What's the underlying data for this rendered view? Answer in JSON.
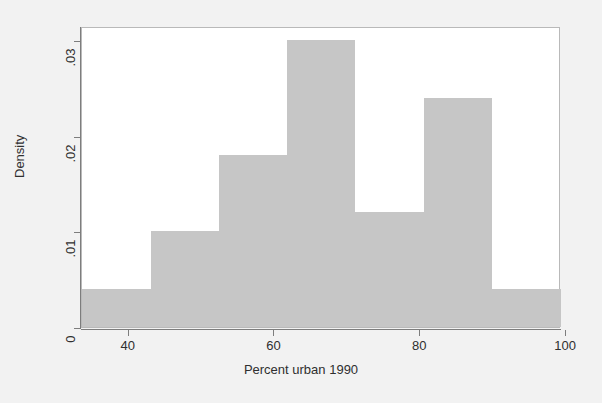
{
  "chart_data": {
    "type": "bar",
    "subtype": "histogram",
    "title": "",
    "subtitle": "",
    "xlabel": "Percent urban 1990",
    "ylabel": "Density",
    "xlim": [
      33.6,
      99.3
    ],
    "ylim": [
      0,
      0.0315
    ],
    "grid": false,
    "legend": null,
    "legend_position": "none",
    "bar_color": "#c6c6c6",
    "axis_color": "#7d7d7d",
    "background_color": "#f2f2f2",
    "plot_background_color": "#ffffff",
    "x_ticks": [
      {
        "value": 40,
        "label": "40"
      },
      {
        "value": 60,
        "label": "60"
      },
      {
        "value": 80,
        "label": "80"
      },
      {
        "value": 100,
        "label": "100"
      }
    ],
    "y_ticks": [
      {
        "value": 0,
        "label": "0"
      },
      {
        "value": 0.01,
        "label": ".01"
      },
      {
        "value": 0.02,
        "label": ".02"
      },
      {
        "value": 0.03,
        "label": ".03"
      }
    ],
    "bins": [
      {
        "x0": 33.6,
        "x1": 43.0,
        "density": 0.004
      },
      {
        "x0": 43.0,
        "x1": 52.4,
        "density": 0.01
      },
      {
        "x0": 52.4,
        "x1": 61.7,
        "density": 0.018
      },
      {
        "x0": 61.7,
        "x1": 71.1,
        "density": 0.03
      },
      {
        "x0": 71.1,
        "x1": 80.5,
        "density": 0.012
      },
      {
        "x0": 80.5,
        "x1": 89.9,
        "density": 0.024
      },
      {
        "x0": 89.9,
        "x1": 99.3,
        "density": 0.004
      }
    ],
    "categories": [
      "33.6-43.0",
      "43.0-52.4",
      "52.4-61.7",
      "61.7-71.1",
      "71.1-80.5",
      "80.5-89.9",
      "89.9-99.3"
    ],
    "values": [
      0.004,
      0.01,
      0.018,
      0.03,
      0.012,
      0.024,
      0.004
    ]
  }
}
